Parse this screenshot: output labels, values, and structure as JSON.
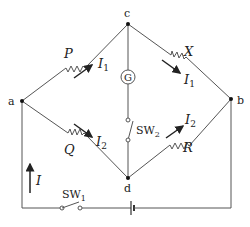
{
  "diagram": {
    "type": "circuit",
    "nodes": {
      "a": {
        "label": "a",
        "x": 22,
        "y": 101
      },
      "b": {
        "label": "b",
        "x": 231,
        "y": 99
      },
      "c": {
        "label": "c",
        "x": 128,
        "y": 24
      },
      "d": {
        "label": "d",
        "x": 128,
        "y": 178
      }
    },
    "resistors": [
      {
        "id": "P",
        "label": "P",
        "from": "a",
        "to": "c",
        "current": "I",
        "current_sub": "1"
      },
      {
        "id": "X",
        "label": "X",
        "from": "c",
        "to": "b",
        "current": "I",
        "current_sub": "1"
      },
      {
        "id": "Q",
        "label": "Q",
        "from": "a",
        "to": "d",
        "current": "I",
        "current_sub": "2"
      },
      {
        "id": "R",
        "label": "R",
        "from": "d",
        "to": "b",
        "current": "I",
        "current_sub": "2"
      }
    ],
    "galvanometer": {
      "label": "G",
      "between": [
        "c",
        "d"
      ]
    },
    "switches": [
      {
        "id": "SW1",
        "label": "SW",
        "sub": "1"
      },
      {
        "id": "SW2",
        "label": "SW",
        "sub": "2"
      }
    ],
    "battery": {
      "label": ""
    },
    "total_current": {
      "label": "I"
    }
  }
}
